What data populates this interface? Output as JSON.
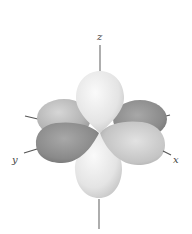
{
  "diagram": {
    "type": "3d-orbital-lobes",
    "axes": {
      "z": {
        "label": "z"
      },
      "y": {
        "label": "y"
      },
      "x": {
        "label": "x"
      }
    },
    "lobes": [
      {
        "name": "top-z-lobe",
        "shade": "light"
      },
      {
        "name": "bottom-z-lobe",
        "shade": "light"
      },
      {
        "name": "back-left-lobe",
        "shade": "medium-light"
      },
      {
        "name": "back-right-lobe",
        "shade": "dark"
      },
      {
        "name": "front-left-lobe",
        "shade": "dark"
      },
      {
        "name": "front-right-lobe",
        "shade": "medium-light"
      }
    ],
    "colors": {
      "light": "#ededed",
      "medium": "#b5b5b5",
      "dark": "#8c8c8c",
      "axis": "#555555"
    }
  }
}
